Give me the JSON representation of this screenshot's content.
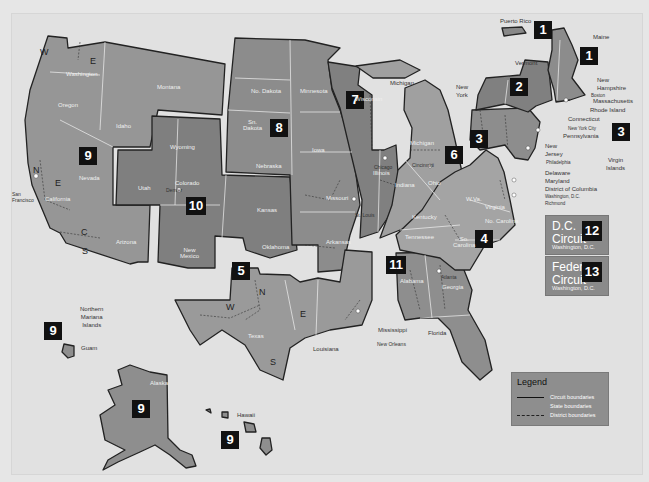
{
  "map": {
    "title": "U.S. Federal Courts of Appeals Circuit Boundaries",
    "circuits": [
      {
        "number": "1",
        "states": [
          "Maine",
          "New Hampshire",
          "Massachusetts",
          "Rhode Island",
          "Puerto Rico"
        ]
      },
      {
        "number": "2",
        "states": [
          "New York",
          "Vermont",
          "Connecticut"
        ]
      },
      {
        "number": "3",
        "states": [
          "Pennsylvania",
          "New Jersey",
          "Delaware",
          "Virgin Islands"
        ]
      },
      {
        "number": "4",
        "states": [
          "Maryland",
          "Virginia",
          "West Virginia",
          "No. Carolina",
          "So. Carolina"
        ]
      },
      {
        "number": "5",
        "states": [
          "Texas",
          "Louisiana",
          "Mississippi"
        ]
      },
      {
        "number": "6",
        "states": [
          "Michigan",
          "Ohio",
          "Kentucky",
          "Tennessee"
        ]
      },
      {
        "number": "7",
        "states": [
          "Wisconsin",
          "Illinois",
          "Indiana"
        ]
      },
      {
        "number": "8",
        "states": [
          "No. Dakota",
          "Sn. Dakota",
          "Nebraska",
          "Minnesota",
          "Iowa",
          "Missouri",
          "Arkansas"
        ]
      },
      {
        "number": "9",
        "states": [
          "Washington",
          "Oregon",
          "Idaho",
          "Montana",
          "Nevada",
          "California",
          "Arizona",
          "Alaska",
          "Hawaii",
          "Guam",
          "Northern Mariana Islands"
        ]
      },
      {
        "number": "10",
        "states": [
          "Wyoming",
          "Utah",
          "Colorado",
          "Kansas",
          "Oklahoma",
          "New Mexico"
        ]
      },
      {
        "number": "11",
        "states": [
          "Alabama",
          "Georgia",
          "Florida"
        ]
      },
      {
        "number": "12",
        "states": [
          "Washington, D.C."
        ]
      },
      {
        "number": "13",
        "states": [
          "Washington, D.C."
        ]
      }
    ],
    "state_labels": {
      "washington": "Washington",
      "oregon": "Oregon",
      "idaho": "Idaho",
      "montana": "Montana",
      "nevada": "Nevada",
      "california": "California",
      "arizona": "Arizona",
      "utah": "Utah",
      "wyoming": "Wyoming",
      "colorado": "Colorado",
      "new_mexico": "New\nMexico",
      "kansas": "Kansas",
      "oklahoma": "Oklahoma",
      "no_dakota": "No. Dakota",
      "sn_dakota": "Sn.\nDakota",
      "nebraska": "Nebraska",
      "minnesota": "Minnesota",
      "iowa": "Iowa",
      "missouri": "Missouri",
      "arkansas": "Arkansas",
      "texas": "Texas",
      "louisiana": "Louisiana",
      "mississippi": "Mississippi",
      "wisconsin": "Wisconsin",
      "illinois": "Illinois",
      "indiana": "Indiana",
      "michigan": "Michigan",
      "michigan_lower": "Michigan",
      "ohio": "Ohio",
      "kentucky": "Kentucky",
      "tennessee": "Tennessee",
      "alabama": "Alabama",
      "georgia": "Georgia",
      "florida": "Florida",
      "virginia": "Virginia",
      "west_virginia": "W.Va.",
      "no_carolina": "No. Carolina",
      "so_carolina": "So.\nCarolina",
      "pennsylvania": "Pennsylvania",
      "new_york": "New\nYork",
      "vermont": "Vermont",
      "maine": "Maine",
      "new_hampshire": "New\nHampshire",
      "massachusetts": "Massachusetts",
      "rhode_island": "Rhode Island",
      "connecticut": "Connecticut",
      "new_jersey": "New\nJersey",
      "delaware": "Delaware",
      "maryland": "Maryland",
      "district_of_columbia": "District of Columbia",
      "puerto_rico": "Puerto Rico",
      "virgin_islands": "Virgin\nIslands",
      "alaska": "Alaska",
      "hawaii": "Hawaii",
      "guam": "Guam",
      "northern_mariana": "Northern\nMariana\nIslands"
    },
    "city_labels": {
      "san_francisco": "San\nFrancisco",
      "denver": "Denver",
      "st_louis": "St. Louis",
      "chicago": "Chicago",
      "cincinnati": "Cincinnati",
      "new_orleans": "New Orleans",
      "atlanta": "Atlanta",
      "philadelphia": "Philadelphia",
      "new_york_city": "New York City",
      "boston": "Boston",
      "washington_dc": "Washington, D.C.",
      "richmond": "Richmond"
    },
    "special_circuits": [
      {
        "name_line1": "D.C.",
        "name_line2": "Circuit",
        "number": "12",
        "location": "Washington, D.C."
      },
      {
        "name_line1": "Federal",
        "name_line2": "Circuit",
        "number": "13",
        "location": "Washington, D.C."
      }
    ],
    "legend": {
      "title": "Legend",
      "items": [
        {
          "style": "solid-thick",
          "label": "Circuit boundaries"
        },
        {
          "style": "solid-thin",
          "label": "State boundaries"
        },
        {
          "style": "dashed",
          "label": "District boundaries"
        }
      ]
    },
    "colors": {
      "background": "#e1e1e1",
      "circuit_dark": "#7f7f7f",
      "circuit_mid": "#8c8c8c",
      "circuit_light": "#9a9a9a",
      "badge": "#111111",
      "state_line": "#f2f2f2"
    }
  }
}
